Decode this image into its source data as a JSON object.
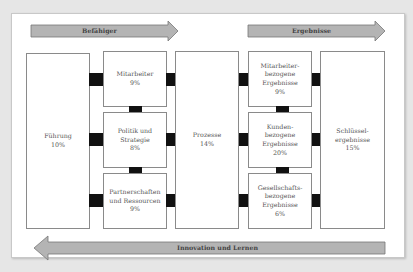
{
  "diagram": {
    "colors": {
      "arrow_fill": "#b4b4b4",
      "arrow_stroke": "#777777",
      "connector": "#111111",
      "box_border": "#8a8a8a"
    },
    "top_arrows": [
      {
        "label": "Befähiger"
      },
      {
        "label": "Ergebnisse"
      }
    ],
    "bottom_arrow": {
      "label": "Innovation und Lernen"
    },
    "boxes": {
      "fuehrung": {
        "label": "Führung\n10%"
      },
      "mitarbeiter": {
        "label": "Mitarbeiter\n9%"
      },
      "politik": {
        "label": "Politik und\nStrategie\n8%"
      },
      "partner": {
        "label": "Partnerschaften\nund Ressourcen\n9%"
      },
      "prozesse": {
        "label": "Prozesse\n14%"
      },
      "mitarbeiter_ergebnisse": {
        "label": "Mitarbeiter-\nbezogene\nErgebnisse\n9%"
      },
      "kunden_ergebnisse": {
        "label": "Kunden-\nbezogene\nErgebnisse\n20%"
      },
      "gesellschaft_ergebnisse": {
        "label": "Gesellschafts-\nbezogene\nErgebnisse\n6%"
      },
      "schluessel": {
        "label": "Schlüssel-\nergebnisse\n15%"
      }
    }
  }
}
